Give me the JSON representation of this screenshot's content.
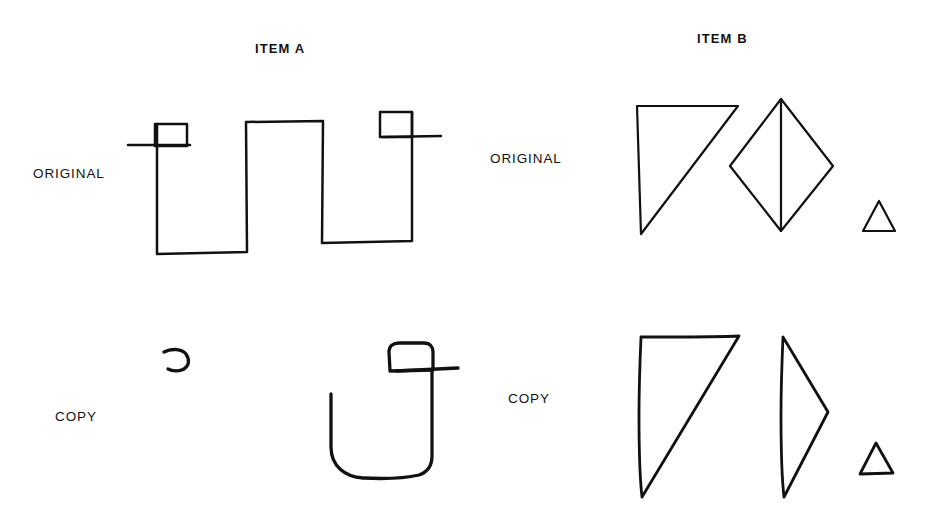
{
  "figure": {
    "width": 933,
    "height": 511,
    "background": "#ffffff",
    "ink_color": "#111111"
  },
  "titles": {
    "item_a": "ITEM A",
    "item_b": "ITEM B"
  },
  "row_labels": {
    "original_left": "ORIGINAL",
    "copy_left": "COPY",
    "original_right": "ORIGINAL",
    "copy_right": "COPY"
  },
  "drawings": {
    "item_a_original": {
      "caption": "ITEM A",
      "row": "ORIGINAL",
      "description": "square-wave / crenellated line with a small square at each upper end crossed by a short horizontal stroke",
      "paths": [
        "M157,124 L157,254 L247,252 L246,122 L323,121 L322,243 L412,241 L412,112",
        "M155,124 L187,124 L187,146 L155,146 Z",
        "M128,145 L190,145",
        "M380,112 L412,112 L412,137 L380,137 Z",
        "M383,137 L441,136"
      ]
    },
    "item_a_copy": {
      "caption": "ITEM A",
      "row": "COPY",
      "description": "small open hook on the left; a large U-shape with a small square and a horizontal stroke at its top right",
      "paths": [
        "M164,352 C172,348 182,349 186,354 C190,360 189,366 184,369 C179,372 172,371 168,369",
        "M331,394 L331,447 C331,466 345,477 363,478 C383,479 406,478 419,475 C428,472 432,465 432,456 L432,370",
        "M389,352 C389,346 393,343 399,343 L424,343 C430,343 433,347 433,352 L433,370 L390,371 Z",
        "M396,371 L458,368"
      ]
    },
    "item_b_original": {
      "caption": "ITEM B",
      "row": "ORIGINAL",
      "description": "right triangle with vertical left side; a diamond bisected by a vertical line; a small separate triangle",
      "paths": [
        "M637,106 L738,106 L641,234 Z",
        "M781,99 L833,166 L781,231 L730,166 Z",
        "M781,99 L781,231",
        "M879,201 L895,231 L863,231 Z"
      ]
    },
    "item_b_copy": {
      "caption": "ITEM B",
      "row": "COPY",
      "description": "shaky right triangle; a right-pointing triangle (half a diamond); a small separate triangle",
      "paths": [
        "M641,337 C640,360 639,390 639,415 C639,450 640,480 642,497 L739,336 C720,337 690,337 666,337 C656,337 647,337 641,337 Z",
        "M783,337 C782,360 781,390 781,415 C781,450 782,480 784,497 L828,412 L783,337 Z",
        "M876,443 L893,473 L860,474 Z"
      ]
    }
  }
}
